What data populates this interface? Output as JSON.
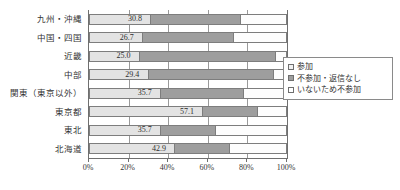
{
  "chart_data": {
    "type": "bar",
    "orientation": "horizontal",
    "stacked": true,
    "stack_mode": "percent",
    "title": "",
    "xlabel": "",
    "ylabel": "",
    "xlim": [
      0,
      100
    ],
    "grid": true,
    "legend_position": "right",
    "xtick_labels": [
      "0%",
      "20%",
      "40%",
      "60%",
      "80%",
      "100%"
    ],
    "xtick_values": [
      0,
      20,
      40,
      60,
      80,
      100
    ],
    "categories": [
      "九州・沖縄",
      "中国・四国",
      "近畿",
      "中部",
      "関東（東京以外）",
      "東京都",
      "東北",
      "北海道"
    ],
    "series": [
      {
        "name": "参加",
        "color": "#e3e3e3",
        "values": [
          30.8,
          26.7,
          25.0,
          29.4,
          35.7,
          57.1,
          35.7,
          42.9
        ]
      },
      {
        "name": "不参加・返信なし",
        "color": "#9e9e9e",
        "values": [
          46.1,
          46.6,
          70.0,
          64.7,
          42.9,
          28.6,
          28.6,
          28.6
        ]
      },
      {
        "name": "いないため不参加",
        "color": "#ffffff",
        "values": [
          23.1,
          26.7,
          5.0,
          5.9,
          21.4,
          14.3,
          35.7,
          28.5
        ]
      }
    ],
    "data_labels": [
      "30.8",
      "26.7",
      "25.0",
      "29.4",
      "35.7",
      "57.1",
      "35.7",
      "42.9"
    ]
  },
  "legend": {
    "items": [
      {
        "label": "参加",
        "marker": "square-light"
      },
      {
        "label": "不参加・返信なし",
        "marker": "square-gray"
      },
      {
        "label": "いないため不参加",
        "marker": "square-white"
      }
    ]
  }
}
